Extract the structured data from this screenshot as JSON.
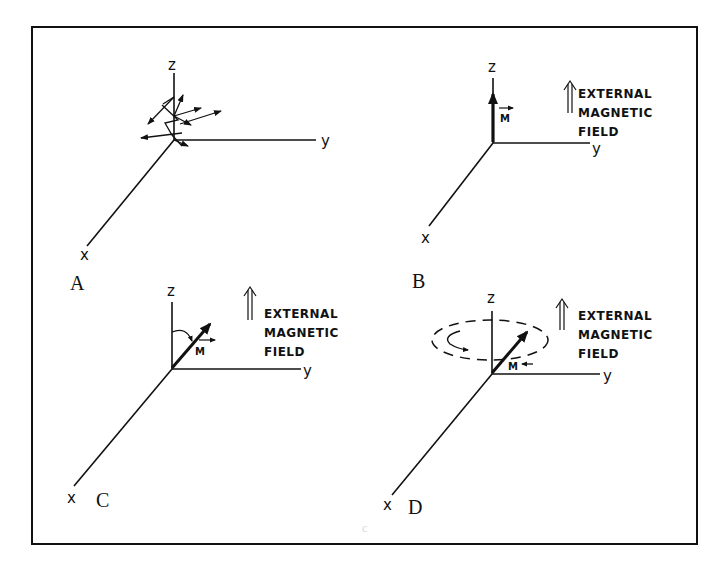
{
  "figure": {
    "frame": {
      "x": 32,
      "y": 27,
      "width": 665,
      "height": 517
    },
    "stroke_color": "#111111",
    "background": "#ffffff",
    "stray_mark": "c"
  },
  "axes_labels": {
    "z": "z",
    "y": "y",
    "x": "x"
  },
  "field_label": {
    "line1": "EXTERNAL",
    "line2": "MAGNETIC",
    "line3": "FIELD"
  },
  "vector_label": "M",
  "panels": [
    {
      "id": "A",
      "letter": "A",
      "description": "Random orientation of magnetic moments, no external field",
      "has_field": false
    },
    {
      "id": "B",
      "letter": "B",
      "description": "Net magnetization M aligned with z along external field",
      "has_field": true
    },
    {
      "id": "C",
      "letter": "C",
      "description": "Magnetization M tipped away from z axis",
      "has_field": true
    },
    {
      "id": "D",
      "letter": "D",
      "description": "Magnetization M precessing around z axis",
      "has_field": true
    }
  ]
}
